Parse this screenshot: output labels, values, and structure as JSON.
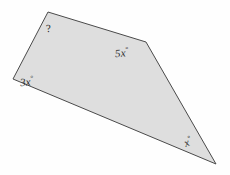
{
  "figure": {
    "type": "polygon-angle-diagram",
    "shape_name": "quadrilateral",
    "fill_color": "#dedede",
    "stroke_color": "#4a4a4a",
    "stroke_width": 1,
    "background_color": "#fefefe",
    "vertices": [
      {
        "name": "top",
        "x": 48,
        "y": 12
      },
      {
        "name": "upper-right",
        "x": 146,
        "y": 42
      },
      {
        "name": "bottom-right-tip",
        "x": 216,
        "y": 164
      },
      {
        "name": "left",
        "x": 13,
        "y": 79
      }
    ],
    "points_string": "48,12 146,42 216,164 13,79"
  },
  "labels": {
    "unknown": {
      "text": "?",
      "at_vertex": "top"
    },
    "five_x": {
      "value": "5x",
      "degree": "°",
      "at_vertex": "upper-right"
    },
    "three_x": {
      "value": "3x",
      "degree": "°",
      "at_vertex": "left"
    },
    "x": {
      "value": "x",
      "degree": "°",
      "at_vertex": "bottom-right-tip"
    }
  }
}
